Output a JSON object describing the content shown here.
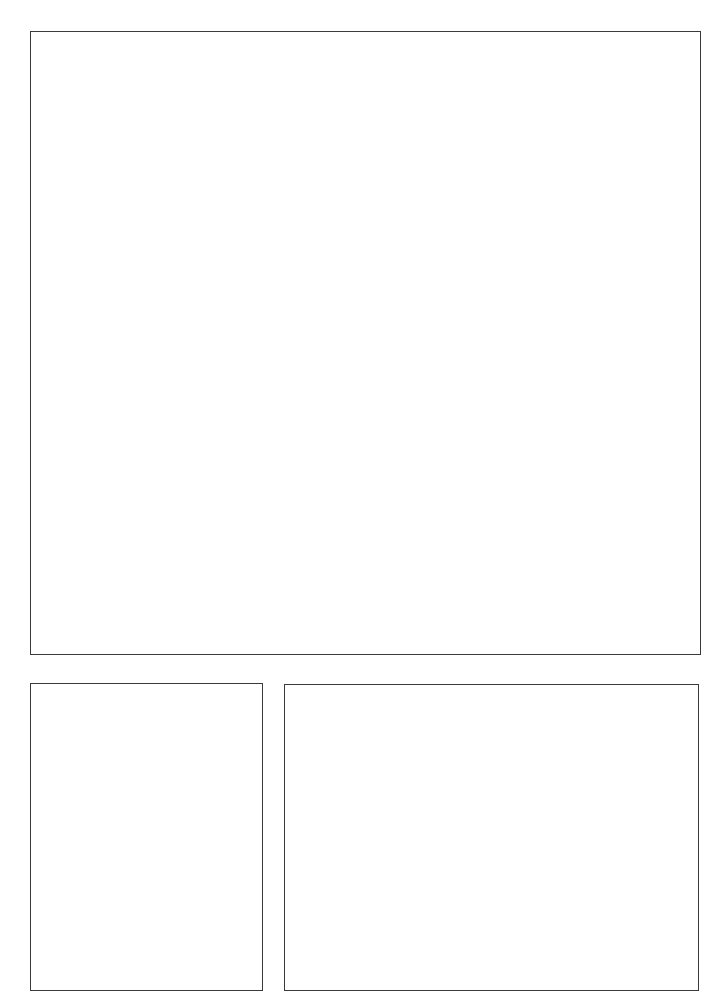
{
  "page": {
    "type": "blank comic panel layout",
    "background_color": "#ffffff",
    "border_color": "#3a3a3a"
  },
  "panels": [
    {
      "id": "top",
      "label": ""
    },
    {
      "id": "bottom-left",
      "label": ""
    },
    {
      "id": "bottom-right",
      "label": ""
    }
  ]
}
